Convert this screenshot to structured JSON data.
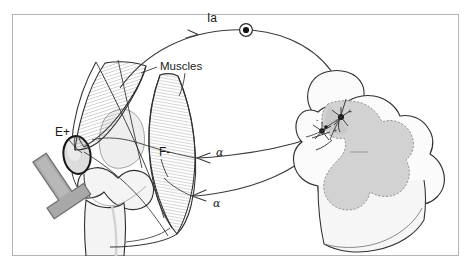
{
  "figure": {
    "frame": {
      "border_color": "#b4b4b4",
      "background_color": "#ffffff",
      "x": 12,
      "y": 14,
      "width": 447,
      "height": 242
    },
    "labels": {
      "afferent": "Ia",
      "muscles": "Muscles",
      "extensor": "E+",
      "flexor": "F-",
      "efferent_upper": "α",
      "efferent_lower": "α",
      "interneuron_plus": "+",
      "motoneuron_minus": "-",
      "motoneuron_plus2": "+"
    },
    "colors": {
      "ink": "#1a1a1a",
      "line": "#3a3a3a",
      "hatch": "#5a5a5a",
      "bone_fill": "#f2f2f2",
      "bone_shade": "#e6e6e6",
      "patella_fill": "#dcdcdc",
      "hammer_fill": "#a8a8a8",
      "hammer_stroke": "#6e6e6e",
      "cord_white_matter": "#fbfbfb",
      "cord_gray_matter": "#d2d2d2",
      "cord_shade": "#ededed",
      "frame": "#b4b4b4"
    },
    "parts": [
      {
        "name": "reflex-hammer",
        "description": "Gray T-shaped percussion hammer striking the patellar tendon"
      },
      {
        "name": "patella",
        "description": "Dark-outlined oval kneecap"
      },
      {
        "name": "femur-condyles",
        "description": "Distal femur with two condyles"
      },
      {
        "name": "tibia",
        "description": "Proximal tibia shaft"
      },
      {
        "name": "extensor-muscle",
        "description": "Hatched quadriceps extensor muscle belly, excited"
      },
      {
        "name": "flexor-muscle",
        "description": "Hatched hamstring flexor muscle belly, inhibited"
      },
      {
        "name": "ia-afferent-fiber",
        "description": "Sensory Ia afferent arc from muscle spindle to dorsal root ganglion and into cord"
      },
      {
        "name": "dorsal-root-ganglion",
        "description": "Circle with filled center on the Ia afferent pathway"
      },
      {
        "name": "alpha-efferent-upper",
        "description": "Alpha motor axon from cord to extensor muscle, arrowhead pointing left"
      },
      {
        "name": "alpha-efferent-lower",
        "description": "Alpha motor axon from cord to flexor muscle, arrowhead pointing left"
      },
      {
        "name": "spinal-cord",
        "description": "Three-dimensional spinal cord segment with butterfly gray matter"
      },
      {
        "name": "interneuron",
        "description": "Star-shaped inhibitory interneuron marked with signs"
      },
      {
        "name": "motoneuron-pool",
        "description": "Star-shaped alpha motoneurons in the ventral horn"
      }
    ]
  }
}
